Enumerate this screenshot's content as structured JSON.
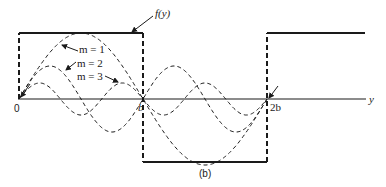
{
  "figure": {
    "caption": "(b)",
    "function_label": "f(y)",
    "axis_label": "y",
    "tick_labels": {
      "origin": "0",
      "b": "b",
      "two_b": "2b"
    },
    "modes": [
      {
        "label": "m = 1",
        "m": 1
      },
      {
        "label": "m = 2",
        "m": 2
      },
      {
        "label": "m = 3",
        "m": 3
      }
    ],
    "square_wave": {
      "description": "f(y) = +1 on (0,b), -1 on (b,2b), +1 beyond 2b",
      "levels": [
        1,
        -1,
        1
      ]
    }
  }
}
